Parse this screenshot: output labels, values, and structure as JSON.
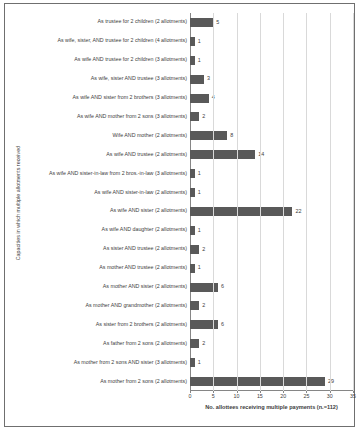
{
  "chart_data": {
    "type": "bar",
    "orientation": "horizontal",
    "title": "",
    "xlabel": "No. allottees receiving multiple payments (n.=112)",
    "ylabel": "Capacities in which multiple allotments received",
    "xlim": [
      0,
      35
    ],
    "xticks": [
      0,
      5,
      10,
      15,
      20,
      25,
      30,
      35
    ],
    "grid": true,
    "legend": false,
    "bar_color": "#595959",
    "categories": [
      "As trustee for 2 children (2 allotments)",
      "As wife, sister, AND trustee for 2 children (4 allotments)",
      "As wife AND trustee for 2 children (3 allotments)",
      "As wife, sister AND trustee (3 allotments)",
      "As wife AND sister from 2 brothers (3 allotments)",
      "As wife AND mother from 2 sons (3 allotments)",
      "Wife AND mother (2 allotments)",
      "As wife AND trustee (2 allotments)",
      "As wife AND sister-in-law from 2 bros.-in-law (3 allotments)",
      "As wife AND sister-in-law (2 allotments)",
      "As wife AND sister (2 allotments)",
      "As wife AND daughter (2 allotments)",
      "As sister AND trustee (2 allotments)",
      "As mother AND trustee (2 allotments)",
      "As mother AND sister (2 allotments)",
      "As mother AND grandmother (2 allotments)",
      "As sister from 2 brothers (2 allotments)",
      "As father from 2 sons (2 allotments)",
      "As mother from 2 sons AND sister (3 allotments)",
      "As mother from 2 sons (2 allotments)"
    ],
    "values": [
      5,
      1,
      1,
      3,
      4,
      2,
      8,
      14,
      1,
      1,
      22,
      1,
      2,
      1,
      6,
      2,
      6,
      2,
      1,
      29
    ]
  }
}
